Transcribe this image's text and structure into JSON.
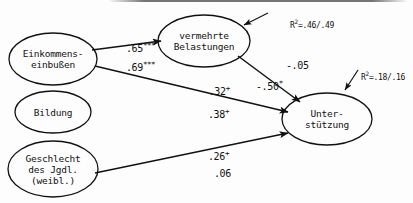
{
  "diagram": {
    "type": "path-diagram",
    "language": "de",
    "nodes": [
      {
        "id": "einkommen",
        "label": "Einkommens-\neinbußen",
        "shape": "ellipse",
        "cx": 53,
        "cy": 59,
        "rx": 44,
        "ry": 26
      },
      {
        "id": "bildung",
        "label": "Bildung",
        "shape": "ellipse",
        "cx": 53,
        "cy": 112,
        "rx": 38,
        "ry": 21
      },
      {
        "id": "geschlecht",
        "label": "Geschlecht\ndes Jgdl.\n(weibl.)",
        "shape": "ellipse",
        "cx": 53,
        "cy": 169,
        "rx": 45,
        "ry": 28
      },
      {
        "id": "belastungen",
        "label": "vermehrte\nBelastungen",
        "shape": "ellipse",
        "cx": 204,
        "cy": 41,
        "rx": 46,
        "ry": 26
      },
      {
        "id": "unterstuetzung",
        "label": "Unter-\nstützung",
        "shape": "ellipse",
        "cx": 327,
        "cy": 119,
        "rx": 45,
        "ry": 26
      }
    ],
    "paths": [
      {
        "id": "einkommen-belastungen",
        "from": "einkommen",
        "to": "belastungen",
        "coefficients": [
          "0.65",
          "0.69"
        ],
        "labels": [
          ".65",
          ".69"
        ],
        "significance": [
          "***",
          "***"
        ]
      },
      {
        "id": "belastungen-unterstuetzung",
        "from": "belastungen",
        "to": "unterstuetzung",
        "coefficients": [
          "-0.05",
          "-0.50"
        ],
        "labels": [
          "-.05",
          "-.50"
        ],
        "significance": [
          "",
          "*"
        ]
      },
      {
        "id": "einkommen-unterstuetzung",
        "from": "einkommen",
        "to": "unterstuetzung",
        "coefficients": [
          "-0.32",
          "0.38"
        ],
        "labels": [
          "-.32",
          ".38"
        ],
        "significance": [
          "+",
          "+"
        ]
      },
      {
        "id": "geschlecht-unterstuetzung",
        "from": "geschlecht",
        "to": "unterstuetzung",
        "coefficients": [
          "0.26",
          "0.06"
        ],
        "labels": [
          ".26",
          ".06"
        ],
        "significance": [
          "+",
          ""
        ]
      }
    ],
    "coefficient_labels": [
      {
        "id": "coef-065",
        "text": ".65",
        "sup": "***",
        "x": 103,
        "y": 30
      },
      {
        "id": "coef-069",
        "text": ".69",
        "sup": "***",
        "x": 103,
        "y": 49
      },
      {
        "id": "coef-005",
        "text": "-.05",
        "sup": "",
        "x": 263,
        "y": 47
      },
      {
        "id": "coef-050",
        "text": "-.50",
        "sup": "*",
        "x": 233,
        "y": 68
      },
      {
        "id": "coef-032",
        "text": "-.32",
        "sup": "+",
        "x": 180,
        "y": 73
      },
      {
        "id": "coef-038",
        "text": ".38",
        "sup": "+",
        "x": 185,
        "y": 96
      },
      {
        "id": "coef-026",
        "text": ".26",
        "sup": "+",
        "x": 185,
        "y": 138
      },
      {
        "id": "coef-006",
        "text": ".06",
        "sup": "",
        "x": 191,
        "y": 155
      }
    ],
    "rsq_labels": [
      {
        "id": "rsq-belastungen",
        "prefix": "R",
        "sup": "2",
        "value": "=.46/.49",
        "x": 272,
        "y": 10,
        "for": "belastungen"
      },
      {
        "id": "rsq-unterstuetzung",
        "prefix": "R",
        "sup": "2",
        "value": "=.18/.16",
        "x": 343,
        "y": 62,
        "for": "unterstuetzung"
      }
    ],
    "colors": {
      "stroke": "#111111",
      "text": "#111111",
      "background": "#fdfdfd"
    }
  }
}
